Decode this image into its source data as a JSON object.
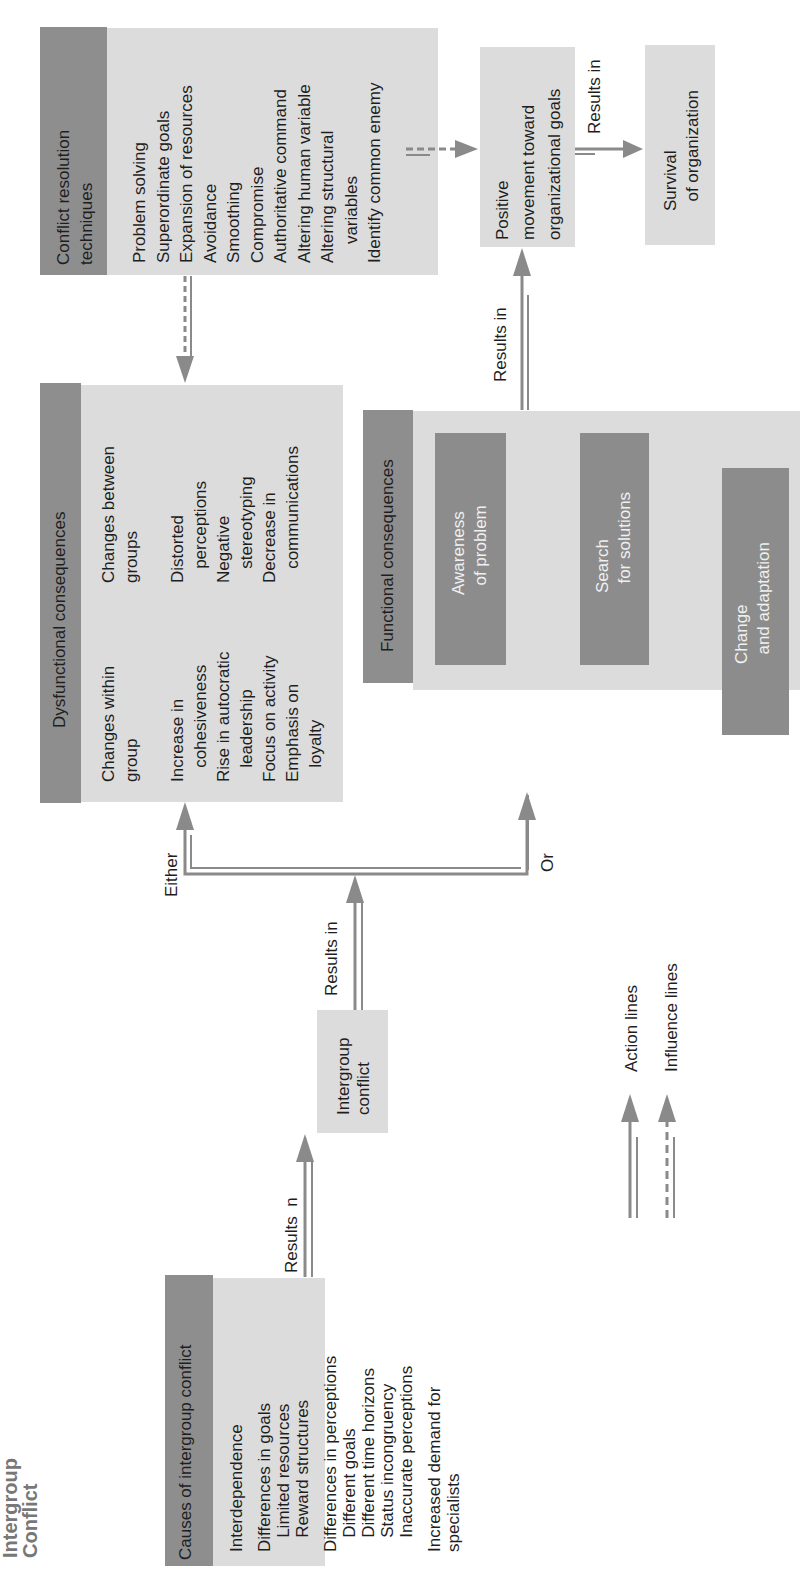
{
  "title": "Intergroup\nConflict",
  "causes": {
    "header": "Causes of intergroup conflict",
    "items": [
      "Interdependence",
      "",
      "Differences in goals",
      "   Limited resources",
      "   Reward structures",
      "",
      "Differences in perceptions",
      "   Different goals",
      "   Different time horizons",
      "   Status incongruency",
      "   Inaccurate perceptions",
      "",
      "Increased demand for",
      "specialists"
    ]
  },
  "conflict_box": "Intergroup\nconflict",
  "labels": {
    "results_n": "Results  n",
    "results_in_1": "Results in",
    "results_in_2": "Results in",
    "results_in_3": "Results in",
    "either": "Either",
    "or": "Or"
  },
  "dysfunctional": {
    "header": "Dysfunctional consequences",
    "within_col": "Changes within\ngroup\n\nIncrease in\n   cohesiveness\nRise in autocratic\n   leadership\nFocus on activity\nEmphasis on\n   loyalty",
    "between_col": "Changes between\ngroups\n\nDistorted\n   perceptions\nNegative\n   stereotyping\nDecrease in\n   communications"
  },
  "functional": {
    "header": "Functional consequences",
    "items": [
      "Awareness\n  of problem",
      "Search\n  for solutions",
      "Change\n  and adaptation"
    ]
  },
  "resolution": {
    "header": "Conflict resolution\ntechniques",
    "items": "Problem solving\nSuperordinate goals\nExpansion of resources\nAvoidance\nSmoothing\nCompromise\nAuthoritative command\nAltering human variable\nAltering structural\n    variables\nIdentify common enemy"
  },
  "positive": "Positive\nmovement toward\norganizational goals",
  "survival": "Survival\n  of organization",
  "legend": {
    "action": "Action lines",
    "influence": "Influence lines"
  },
  "colors": {
    "header_fill": "#8e8e8e",
    "box_fill": "#dcdcdc",
    "inner_fill": "#8c8c8c",
    "line": "#8a8a8a"
  }
}
